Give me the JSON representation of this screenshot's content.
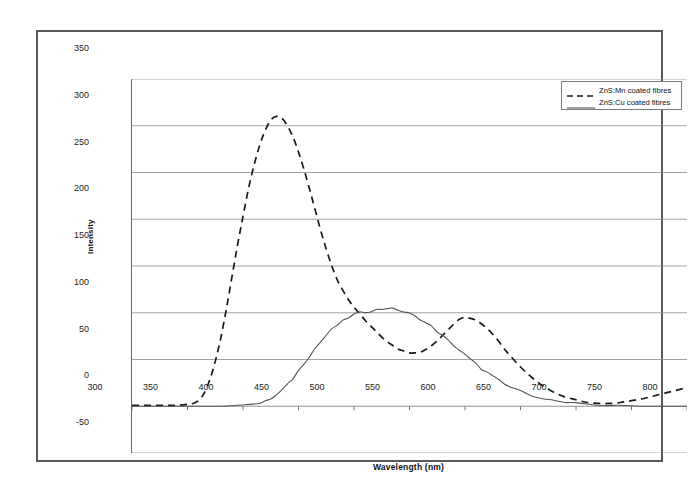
{
  "figure": {
    "frame_color": "#5a5a5a",
    "background": "#ffffff"
  },
  "axis_titles": {
    "x": "Wavelength (nm)",
    "y": "Intensity"
  },
  "legend": {
    "entries": [
      {
        "label": "ZnS:Mn coated fibres",
        "style": "dashed",
        "color": "#1a1a1a"
      },
      {
        "label": "ZnS:Cu coated fibres",
        "style": "solid",
        "color": "#555555"
      }
    ]
  },
  "ticks": {
    "y": [
      "350",
      "300",
      "250",
      "200",
      "150",
      "100",
      "50",
      "0",
      "-50"
    ],
    "x": [
      "300",
      "350",
      "400",
      "450",
      "500",
      "550",
      "600",
      "650",
      "700",
      "750",
      "800"
    ]
  },
  "chart_data": {
    "type": "line",
    "title": "",
    "xlabel": "Wavelength (nm)",
    "ylabel": "Intensity",
    "xlim": [
      300,
      800
    ],
    "ylim": [
      -50,
      350
    ],
    "xticks": [
      300,
      350,
      400,
      450,
      500,
      550,
      600,
      650,
      700,
      750,
      800
    ],
    "yticks": [
      -50,
      0,
      50,
      100,
      150,
      200,
      250,
      300,
      350
    ],
    "grid": "horizontal",
    "legend_position": "top-right",
    "series": [
      {
        "name": "ZnS:Mn coated fibres",
        "style": "dashed",
        "color": "#1a1a1a",
        "x": [
          300,
          310,
          320,
          330,
          340,
          350,
          355,
          360,
          365,
          370,
          375,
          380,
          385,
          390,
          395,
          400,
          405,
          410,
          415,
          420,
          425,
          430,
          435,
          440,
          445,
          450,
          455,
          460,
          465,
          470,
          475,
          480,
          485,
          490,
          495,
          500,
          505,
          510,
          515,
          520,
          525,
          530,
          535,
          540,
          545,
          550,
          555,
          560,
          565,
          570,
          575,
          580,
          585,
          590,
          595,
          600,
          605,
          610,
          615,
          620,
          625,
          630,
          635,
          640,
          650,
          660,
          670,
          680,
          690,
          700,
          710,
          720,
          730,
          740,
          750,
          760,
          770,
          780,
          790,
          800
        ],
        "y": [
          1,
          1,
          1,
          1,
          1,
          2,
          3,
          6,
          14,
          28,
          48,
          73,
          104,
          138,
          172,
          203,
          233,
          258,
          279,
          295,
          306,
          310,
          308,
          300,
          288,
          272,
          253,
          232,
          210,
          188,
          168,
          150,
          135,
          124,
          114,
          106,
          99,
          92,
          86,
          80,
          74,
          69,
          65,
          61,
          59,
          57,
          57,
          58,
          61,
          65,
          70,
          76,
          82,
          88,
          93,
          95,
          94,
          92,
          88,
          83,
          77,
          70,
          62,
          55,
          42,
          31,
          22,
          15,
          10,
          7,
          4,
          3,
          3,
          4,
          6,
          8,
          11,
          14,
          17,
          20
        ]
      },
      {
        "name": "ZnS:Cu coated fibres",
        "style": "solid",
        "color": "#555555",
        "x": [
          300,
          320,
          340,
          360,
          380,
          395,
          405,
          415,
          420,
          425,
          430,
          435,
          440,
          445,
          450,
          455,
          460,
          465,
          470,
          475,
          480,
          485,
          490,
          495,
          500,
          505,
          510,
          515,
          520,
          525,
          530,
          535,
          540,
          545,
          550,
          555,
          560,
          565,
          570,
          575,
          580,
          585,
          590,
          595,
          600,
          605,
          610,
          615,
          620,
          625,
          630,
          635,
          640,
          650,
          660,
          670,
          680,
          690,
          700,
          720,
          740,
          760,
          780,
          800
        ],
        "y": [
          0,
          0,
          0,
          0,
          0,
          1,
          2,
          3,
          5,
          8,
          12,
          17,
          23,
          30,
          38,
          46,
          54,
          62,
          69,
          76,
          82,
          87,
          91,
          95,
          98,
          100,
          101,
          102,
          103,
          104,
          105,
          104,
          103,
          101,
          99,
          96,
          93,
          89,
          85,
          80,
          75,
          70,
          65,
          60,
          55,
          50,
          45,
          40,
          36,
          32,
          28,
          24,
          21,
          16,
          12,
          9,
          6,
          4,
          3,
          1,
          1,
          0,
          0,
          0
        ]
      }
    ]
  }
}
